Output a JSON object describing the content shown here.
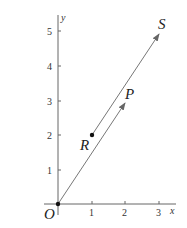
{
  "diagram": {
    "axes": {
      "x_label": "x",
      "y_label": "y",
      "x_ticks": [
        "1",
        "2",
        "3"
      ],
      "y_ticks": [
        "1",
        "2",
        "3",
        "4",
        "5"
      ]
    },
    "points": {
      "origin": "O",
      "R": "R",
      "P": "P",
      "S": "S"
    },
    "vectors": [
      {
        "from": "O",
        "to": "P",
        "from_coord": [
          0,
          0
        ],
        "to_coord": [
          2,
          3
        ]
      },
      {
        "from": "R",
        "to": "S",
        "from_coord": [
          1,
          2
        ],
        "to_coord": [
          3,
          5
        ]
      }
    ],
    "colors": {
      "axis": "#555555",
      "vector": "#777777",
      "point": "#111111"
    }
  }
}
